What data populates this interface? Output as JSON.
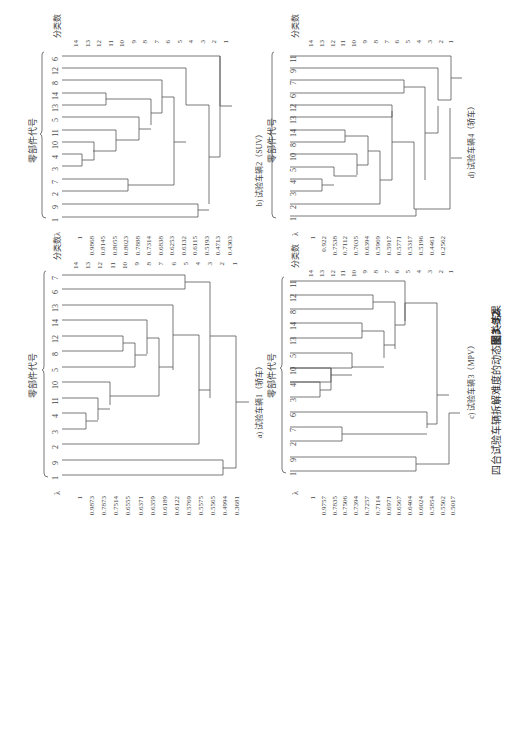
{
  "figure": {
    "number": "图3-32",
    "caption": "四台试验车辆拆解难度的动态聚类结果",
    "axis_part_label": "零部件代号",
    "axis_count_label": "分类数",
    "lambda_label": "λ",
    "count_labels": [
      "14",
      "13",
      "12",
      "11",
      "10",
      "9",
      "8",
      "7",
      "6",
      "5",
      "4",
      "3",
      "2",
      "1"
    ]
  },
  "panels": [
    {
      "id": "a",
      "title": "a) 试验车辆1（轿车）",
      "leaves": [
        "7",
        "6",
        "13",
        "14",
        "12",
        "8",
        "5",
        "10",
        "11",
        "4",
        "3",
        "2",
        "9",
        "1"
      ],
      "lambdas": [
        "1",
        "0.9873",
        "0.7873",
        "0.7514",
        "0.6555",
        "0.6371",
        "0.6359",
        "0.6189",
        "0.6122",
        "0.5769",
        "0.5575",
        "0.5565",
        "0.4994",
        "0.3681"
      ]
    },
    {
      "id": "b",
      "title": "b) 试验车辆2（SUV）",
      "leaves": [
        "6",
        "12",
        "8",
        "14",
        "13",
        "5",
        "11",
        "10",
        "4",
        "3",
        "7",
        "2",
        "9",
        "1"
      ],
      "lambdas": [
        "1",
        "0.9868",
        "0.8145",
        "0.8055",
        "0.8023",
        "0.7888",
        "0.7314",
        "0.6838",
        "0.6253",
        "0.6132",
        "0.6115",
        "0.5193",
        "0.4713",
        "0.4303"
      ]
    },
    {
      "id": "c",
      "title": "c) 试验车辆3（MPV）",
      "leaves": [
        "11",
        "12",
        "8",
        "14",
        "13",
        "5",
        "10",
        "4",
        "3",
        "6",
        "7",
        "2",
        "9",
        "1"
      ],
      "lambdas": [
        "1",
        "0.9757",
        "0.7835",
        "0.7506",
        "0.7394",
        "0.7257",
        "0.7114",
        "0.6971",
        "0.6567",
        "0.6404",
        "0.6024",
        "0.5854",
        "0.5502",
        "0.5017"
      ]
    },
    {
      "id": "d",
      "title": "d) 试验车辆4（轿车）",
      "leaves": [
        "11",
        "9",
        "7",
        "6",
        "12",
        "13",
        "14",
        "8",
        "10",
        "5",
        "4",
        "3",
        "2",
        "1"
      ],
      "lambdas": [
        "1",
        "0.922",
        "0.7538",
        "0.7112",
        "0.7035",
        "0.6394",
        "0.5969",
        "0.5917",
        "0.5771",
        "0.5317",
        "0.5196",
        "0.4461",
        "0.2562"
      ]
    }
  ]
}
